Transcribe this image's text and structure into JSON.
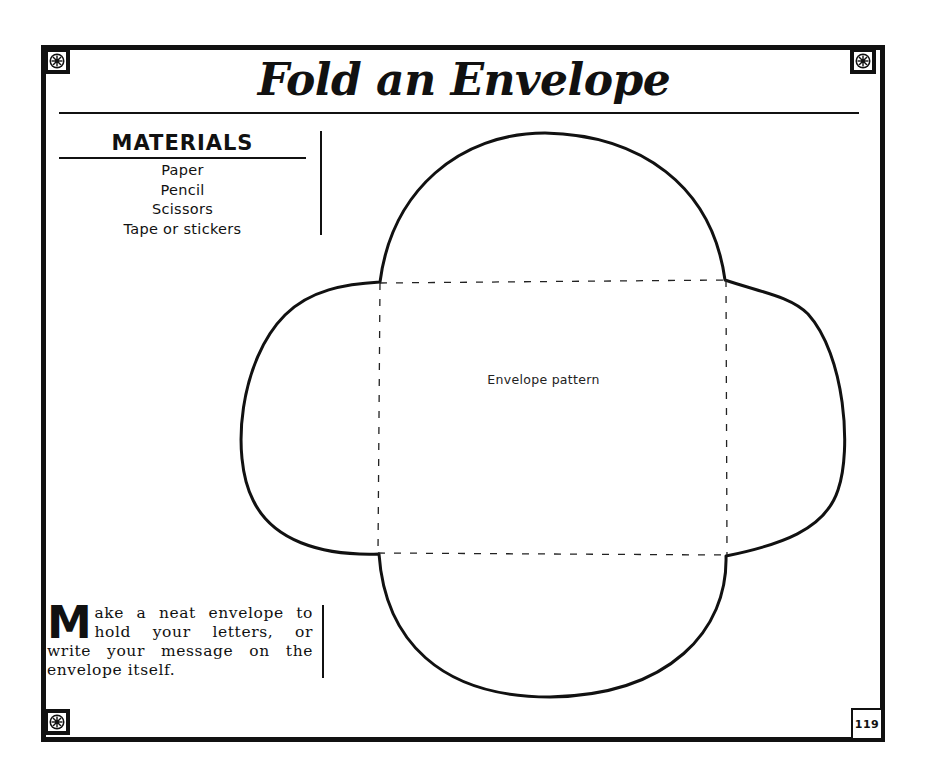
{
  "page": {
    "title": "Fold an Envelope",
    "page_number": "119"
  },
  "materials": {
    "heading": "MATERIALS",
    "items": [
      "Paper",
      "Pencil",
      "Scissors",
      "Tape or stickers"
    ]
  },
  "intro": {
    "drop_cap": "M",
    "text": "ake a neat envelope to hold your letters, or write your message on the envelope itself."
  },
  "pattern": {
    "label": "Envelope pattern",
    "rect": {
      "left": 379,
      "top": 283,
      "right": 726,
      "bottom": 554
    },
    "outline_color": "#111111",
    "fold_line_style": "dashed"
  },
  "decor": {
    "corner_ornament": "snowflake-medallion-icon",
    "border_color": "#111111"
  }
}
